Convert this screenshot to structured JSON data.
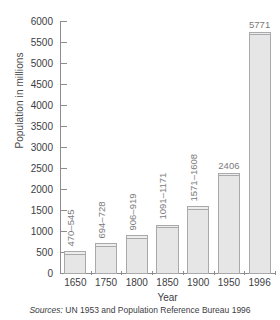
{
  "chart_data": {
    "type": "bar",
    "title": "",
    "xlabel": "Year",
    "ylabel": "Population in millions",
    "categories": [
      "1650",
      "1750",
      "1800",
      "1850",
      "1900",
      "1950",
      "1996"
    ],
    "values": [
      545,
      728,
      919,
      1171,
      1608,
      2406,
      5771
    ],
    "low_values": [
      470,
      694,
      906,
      1091,
      1571,
      2406,
      5771
    ],
    "high_values": [
      545,
      728,
      919,
      1171,
      1608,
      2406,
      5771
    ],
    "data_labels": [
      "470–545",
      "694–728",
      "906–919",
      "1091–1171",
      "1571–1608",
      "2406",
      "5771"
    ],
    "label_orientation": [
      "vertical",
      "vertical",
      "vertical",
      "vertical",
      "vertical",
      "horizontal",
      "horizontal"
    ],
    "ylim": [
      0,
      6000
    ],
    "yticks": [
      0,
      500,
      1000,
      1500,
      2000,
      2500,
      3000,
      3500,
      4000,
      4500,
      5000,
      5500,
      6000
    ],
    "ytick_labels": [
      "0",
      "500",
      "1000",
      "1500",
      "2000",
      "2500",
      "3000",
      "3500",
      "4000",
      "4500",
      "5000",
      "5500",
      "6000"
    ],
    "grid": false,
    "legend": false,
    "bar_fill_color": "#e6e6e6",
    "bar_band_color": "#ededed",
    "bar_border_color": "#a9a9ab",
    "axis_color": "#8d8d8f",
    "label_color": "#7b7b7d"
  },
  "footer": {
    "source_label": "Sources:",
    "source_text": "UN 1953 and Population Reference Bureau 1996"
  }
}
